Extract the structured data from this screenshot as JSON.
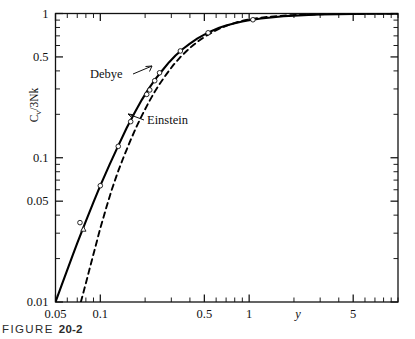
{
  "figure": {
    "caption_word": "FIGURE",
    "caption_number": "20-2"
  },
  "chart_data": {
    "type": "line",
    "title": "",
    "subtitle": "",
    "xlabel": "y",
    "ylabel": "C_v/3Nk",
    "ylabel_display": "C /3Nk",
    "ylabel_sub": "v",
    "xscale": "log",
    "yscale": "log",
    "xlim": [
      0.05,
      10
    ],
    "ylim": [
      0.01,
      1
    ],
    "grid": false,
    "legend_position": "inline-annotations",
    "x_ticks_labeled": [
      {
        "value": 0.05,
        "label": "0.05"
      },
      {
        "value": 0.1,
        "label": "0.1"
      },
      {
        "value": 0.5,
        "label": "0.5"
      },
      {
        "value": 1,
        "label": "1"
      },
      {
        "value": 5,
        "label": "5"
      }
    ],
    "y_ticks_labeled": [
      {
        "value": 0.01,
        "label": "0.01"
      },
      {
        "value": 0.05,
        "label": "0.05"
      },
      {
        "value": 0.1,
        "label": "0.1"
      },
      {
        "value": 0.5,
        "label": "0.5"
      },
      {
        "value": 1,
        "label": "1"
      }
    ],
    "annotations": [
      {
        "text": "Debye",
        "target_series": "Debye",
        "arrow": "up-right"
      },
      {
        "text": "Einstein",
        "target_series": "Einstein",
        "arrow": "left"
      }
    ],
    "series": [
      {
        "name": "Debye",
        "style": "solid",
        "color": "#000000",
        "x": [
          0.05,
          0.055,
          0.06,
          0.065,
          0.07,
          0.08,
          0.09,
          0.1,
          0.115,
          0.13,
          0.15,
          0.17,
          0.19,
          0.21,
          0.235,
          0.26,
          0.29,
          0.32,
          0.36,
          0.4,
          0.45,
          0.5,
          0.56,
          0.63,
          0.7,
          0.8,
          0.9,
          1.0,
          1.2,
          1.4,
          1.7,
          2.0,
          2.5,
          3.0,
          4.0,
          5.0,
          6.5,
          8.0,
          10.0
        ],
        "y": [
          0.01,
          0.0131,
          0.0167,
          0.0209,
          0.0256,
          0.0364,
          0.0493,
          0.064,
          0.089,
          0.117,
          0.16,
          0.205,
          0.252,
          0.298,
          0.352,
          0.401,
          0.46,
          0.511,
          0.57,
          0.619,
          0.672,
          0.714,
          0.757,
          0.796,
          0.825,
          0.856,
          0.879,
          0.898,
          0.923,
          0.939,
          0.956,
          0.966,
          0.977,
          0.983,
          0.99,
          0.993,
          0.996,
          0.9975,
          0.9985
        ]
      },
      {
        "name": "Einstein",
        "style": "dashed",
        "color": "#000000",
        "x": [
          0.074,
          0.08,
          0.086,
          0.092,
          0.1,
          0.11,
          0.12,
          0.132,
          0.145,
          0.16,
          0.175,
          0.192,
          0.21,
          0.232,
          0.255,
          0.28,
          0.31,
          0.345,
          0.38,
          0.42,
          0.47,
          0.52,
          0.58,
          0.65,
          0.73,
          0.82,
          0.92,
          1.05,
          1.2,
          1.4,
          1.7,
          2.0,
          2.5,
          3.0,
          4.0,
          5.0,
          6.5,
          8.0,
          10.0
        ],
        "y": [
          0.01,
          0.0135,
          0.018,
          0.0234,
          0.0325,
          0.0455,
          0.061,
          0.081,
          0.104,
          0.133,
          0.164,
          0.2,
          0.239,
          0.287,
          0.334,
          0.383,
          0.44,
          0.499,
          0.55,
          0.603,
          0.659,
          0.706,
          0.752,
          0.796,
          0.834,
          0.867,
          0.894,
          0.918,
          0.936,
          0.951,
          0.966,
          0.975,
          0.984,
          0.989,
          0.993,
          0.996,
          0.9975,
          0.9985,
          0.999
        ]
      }
    ],
    "data_markers": [
      {
        "x": 0.073,
        "y": 0.0355,
        "shape": "circle"
      },
      {
        "x": 0.077,
        "y": 0.032,
        "shape": "triangle"
      },
      {
        "x": 0.1,
        "y": 0.064,
        "shape": "circle"
      },
      {
        "x": 0.132,
        "y": 0.12,
        "shape": "circle"
      },
      {
        "x": 0.16,
        "y": 0.178,
        "shape": "circle"
      },
      {
        "x": 0.205,
        "y": 0.275,
        "shape": "circle"
      },
      {
        "x": 0.215,
        "y": 0.295,
        "shape": "circle"
      },
      {
        "x": 0.232,
        "y": 0.342,
        "shape": "circle"
      },
      {
        "x": 0.25,
        "y": 0.388,
        "shape": "circle"
      },
      {
        "x": 0.345,
        "y": 0.55,
        "shape": "circle"
      },
      {
        "x": 0.53,
        "y": 0.735,
        "shape": "circle"
      },
      {
        "x": 1.06,
        "y": 0.905,
        "shape": "circle"
      }
    ]
  }
}
